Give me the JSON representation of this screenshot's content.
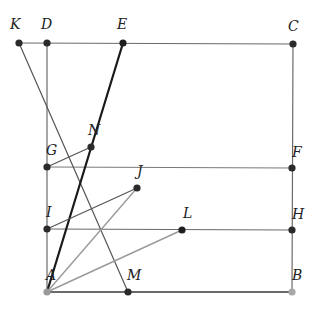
{
  "diagram": {
    "points": {
      "K": {
        "x": 19,
        "y": 43,
        "label": "K",
        "lx": 10,
        "ly": 25,
        "color": "#2a2a2a"
      },
      "D": {
        "x": 47,
        "y": 43,
        "label": "D",
        "lx": 41,
        "ly": 25,
        "color": "#2a2a2a"
      },
      "E": {
        "x": 123,
        "y": 43,
        "label": "E",
        "lx": 117,
        "ly": 25,
        "color": "#1e1e1e"
      },
      "C": {
        "x": 293,
        "y": 44,
        "label": "C",
        "lx": 288,
        "ly": 27,
        "color": "#2a2a2a"
      },
      "N": {
        "x": 91,
        "y": 147,
        "label": "N",
        "lx": 88,
        "ly": 131,
        "color": "#2a2a2a"
      },
      "G": {
        "x": 47,
        "y": 167,
        "label": "G",
        "lx": 46,
        "ly": 151,
        "color": "#2a2a2a"
      },
      "F": {
        "x": 292,
        "y": 168,
        "label": "F",
        "lx": 292,
        "ly": 153,
        "color": "#2a2a2a"
      },
      "J": {
        "x": 137,
        "y": 188,
        "label": "J",
        "lx": 137,
        "ly": 172,
        "color": "#2a2a2a"
      },
      "I": {
        "x": 47,
        "y": 229,
        "label": "I",
        "lx": 46,
        "ly": 213,
        "color": "#2a2a2a"
      },
      "L": {
        "x": 182,
        "y": 230,
        "label": "L",
        "lx": 183,
        "ly": 214,
        "color": "#1e1e1e"
      },
      "H": {
        "x": 292,
        "y": 230,
        "label": "H",
        "lx": 292,
        "ly": 215,
        "color": "#2a2a2a"
      },
      "A": {
        "x": 47,
        "y": 292,
        "label": "A",
        "lx": 46,
        "ly": 276,
        "color": "#9a9a9a"
      },
      "M": {
        "x": 128,
        "y": 292,
        "label": "M",
        "lx": 127,
        "ly": 276,
        "color": "#2a2a2a"
      },
      "B": {
        "x": 292,
        "y": 292,
        "label": "B",
        "lx": 292,
        "ly": 276,
        "color": "#a8a8a8"
      }
    },
    "segments": [
      {
        "from": "K",
        "to": "C",
        "color": "#6a6a6a",
        "width": 1.2
      },
      {
        "from": "D",
        "to": "A",
        "color": "#6a6a6a",
        "width": 1.2
      },
      {
        "from": "C",
        "to": "B",
        "color": "#6a6a6a",
        "width": 1.2
      },
      {
        "from": "A",
        "to": "B",
        "color": "#3a3a3a",
        "width": 1.6
      },
      {
        "from": "G",
        "to": "F",
        "color": "#7a7a7a",
        "width": 1.2
      },
      {
        "from": "I",
        "to": "H",
        "color": "#6a6a6a",
        "width": 1.2
      },
      {
        "from": "K",
        "to": "M",
        "color": "#555555",
        "width": 1.2
      },
      {
        "from": "A",
        "to": "E",
        "color": "#1a1a1a",
        "width": 2.2
      },
      {
        "from": "G",
        "to": "N",
        "color": "#555555",
        "width": 1.2
      },
      {
        "from": "I",
        "to": "J",
        "color": "#555555",
        "width": 1.2
      },
      {
        "from": "A",
        "to": "J",
        "color": "#9a9a9a",
        "width": 1.4
      },
      {
        "from": "A",
        "to": "L",
        "color": "#9a9a9a",
        "width": 1.4
      }
    ],
    "point_radius": 3.6
  }
}
